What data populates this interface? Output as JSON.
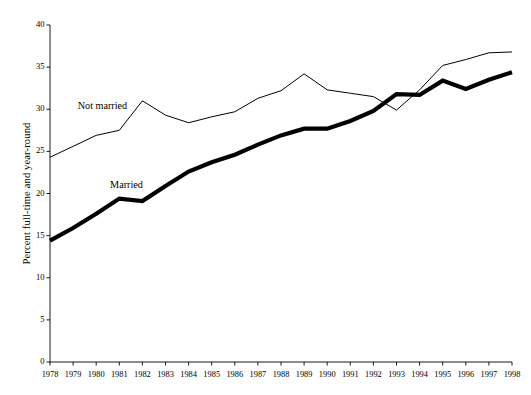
{
  "chart_data": {
    "type": "line",
    "title": "",
    "xlabel": "",
    "ylabel": "Percent full-time and year-round",
    "xlim": [
      1978,
      1998
    ],
    "ylim": [
      0,
      40
    ],
    "ytick_step": 5,
    "grid": false,
    "legend_position": "inline-annotation",
    "categories": [
      "1978",
      "1979",
      "1980",
      "1981",
      "1982",
      "1983",
      "1984",
      "1985",
      "1986",
      "1987",
      "1988",
      "1989",
      "1990",
      "1991",
      "1992",
      "1993",
      "1994",
      "1995",
      "1996",
      "1997",
      "1998"
    ],
    "ytick_labels": [
      "0",
      "5",
      "10",
      "15",
      "20",
      "25",
      "30",
      "35",
      "40"
    ],
    "series": [
      {
        "name": "Not married",
        "style": "thin",
        "color": "#000000",
        "values": [
          24.3,
          25.6,
          26.9,
          27.5,
          31.0,
          29.3,
          28.4,
          29.1,
          29.7,
          31.3,
          32.2,
          34.2,
          32.3,
          31.9,
          31.5,
          29.9,
          32.3,
          35.2,
          35.9,
          36.7,
          36.8
        ]
      },
      {
        "name": "Married",
        "style": "thick",
        "color": "#000000",
        "values": [
          14.4,
          15.9,
          17.6,
          19.4,
          19.1,
          20.9,
          22.6,
          23.7,
          24.6,
          25.8,
          26.9,
          27.7,
          27.7,
          28.6,
          29.8,
          31.8,
          31.7,
          33.4,
          32.4,
          33.5,
          34.4
        ]
      }
    ],
    "annotations": [
      {
        "text": "Not married",
        "x": 1979.2,
        "y": 30.4
      },
      {
        "text": "Married",
        "x": 1980.6,
        "y": 21.0
      }
    ]
  }
}
